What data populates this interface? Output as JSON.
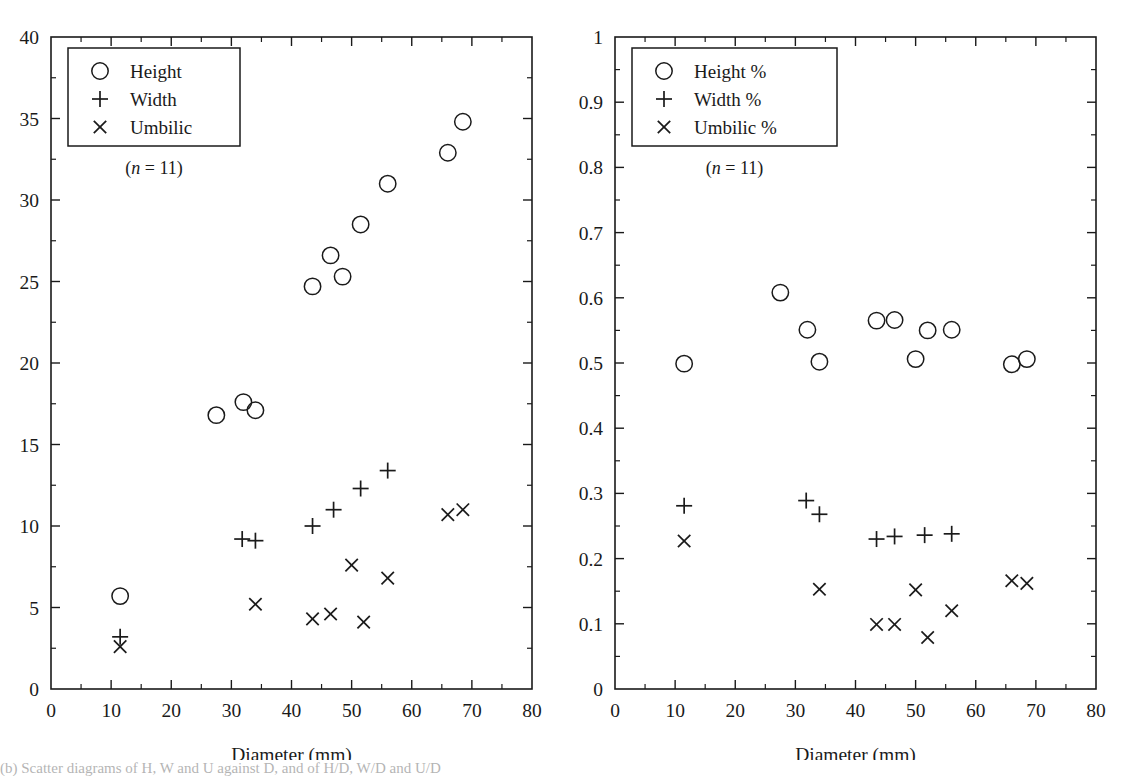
{
  "figure": {
    "panels": [
      "left",
      "right"
    ],
    "caption_partial": "(b) Scatter diagrams of H, W and U against D, and of H/D, W/D and U/D"
  },
  "chart_data": [
    {
      "type": "scatter",
      "panel": "left",
      "title": "",
      "xlabel": "Diameter (mm)",
      "ylabel": "",
      "xlim": [
        0,
        80
      ],
      "ylim": [
        0,
        40
      ],
      "xticks": [
        0,
        10,
        20,
        30,
        40,
        50,
        60,
        70,
        80
      ],
      "yticks": [
        0,
        5,
        10,
        15,
        20,
        25,
        30,
        35,
        40
      ],
      "xtick_labels": [
        "0",
        "10",
        "20",
        "30",
        "40",
        "50",
        "60",
        "70",
        "80"
      ],
      "ytick_labels": [
        "0",
        "5",
        "10",
        "15",
        "20",
        "25",
        "30",
        "35",
        "40"
      ],
      "grid": false,
      "legend_position": "upper-left",
      "legend_entries": [
        {
          "marker": "circle",
          "label": "Height"
        },
        {
          "marker": "plus",
          "label": "Width"
        },
        {
          "marker": "cross",
          "label": "Umbilic"
        }
      ],
      "annotation": "(n = 11)",
      "annotation_italic_part": "n",
      "x": [
        11.5,
        27.5,
        32.0,
        34.0,
        43.5,
        46.5,
        50.0,
        52.0,
        56.0,
        66.0,
        68.5
      ],
      "series": [
        {
          "name": "Height",
          "marker": "circle",
          "values": [
            5.7,
            16.8,
            17.6,
            17.1,
            24.7,
            26.6,
            25.3,
            28.5,
            31.0,
            32.9,
            34.8
          ]
        },
        {
          "name": "Width",
          "marker": "plus",
          "values": [
            3.2,
            null,
            9.2,
            9.1,
            10.0,
            11.0,
            12.3,
            null,
            13.4,
            null,
            null
          ]
        },
        {
          "name": "Umbilic",
          "marker": "cross",
          "values": [
            2.6,
            null,
            null,
            5.2,
            4.3,
            4.6,
            7.6,
            4.1,
            6.8,
            10.7,
            11.0
          ]
        }
      ],
      "points": [
        {
          "series": "Height",
          "x": 11.5,
          "y": 5.7
        },
        {
          "series": "Height",
          "x": 27.5,
          "y": 16.8
        },
        {
          "series": "Height",
          "x": 32.0,
          "y": 17.6
        },
        {
          "series": "Height",
          "x": 34.0,
          "y": 17.1
        },
        {
          "series": "Height",
          "x": 43.5,
          "y": 24.7
        },
        {
          "series": "Height",
          "x": 46.5,
          "y": 26.6
        },
        {
          "series": "Height",
          "x": 48.5,
          "y": 25.3
        },
        {
          "series": "Height",
          "x": 51.5,
          "y": 28.5
        },
        {
          "series": "Height",
          "x": 56.0,
          "y": 31.0
        },
        {
          "series": "Height",
          "x": 66.0,
          "y": 32.9
        },
        {
          "series": "Height",
          "x": 68.5,
          "y": 34.8
        },
        {
          "series": "Width",
          "x": 11.5,
          "y": 3.2
        },
        {
          "series": "Width",
          "x": 31.8,
          "y": 9.2
        },
        {
          "series": "Width",
          "x": 34.0,
          "y": 9.1
        },
        {
          "series": "Width",
          "x": 43.5,
          "y": 10.0
        },
        {
          "series": "Width",
          "x": 47.0,
          "y": 11.0
        },
        {
          "series": "Width",
          "x": 51.5,
          "y": 12.3
        },
        {
          "series": "Width",
          "x": 56.0,
          "y": 13.4
        },
        {
          "series": "Umbilic",
          "x": 11.5,
          "y": 2.6
        },
        {
          "series": "Umbilic",
          "x": 34.0,
          "y": 5.2
        },
        {
          "series": "Umbilic",
          "x": 43.5,
          "y": 4.3
        },
        {
          "series": "Umbilic",
          "x": 46.5,
          "y": 4.6
        },
        {
          "series": "Umbilic",
          "x": 50.0,
          "y": 7.6
        },
        {
          "series": "Umbilic",
          "x": 52.0,
          "y": 4.1
        },
        {
          "series": "Umbilic",
          "x": 56.0,
          "y": 6.8
        },
        {
          "series": "Umbilic",
          "x": 66.0,
          "y": 10.7
        },
        {
          "series": "Umbilic",
          "x": 68.5,
          "y": 11.0
        }
      ]
    },
    {
      "type": "scatter",
      "panel": "right",
      "title": "",
      "xlabel": "Diameter (mm)",
      "ylabel": "",
      "xlim": [
        0,
        80
      ],
      "ylim": [
        0,
        1
      ],
      "xticks": [
        0,
        10,
        20,
        30,
        40,
        50,
        60,
        70,
        80
      ],
      "yticks": [
        0,
        0.1,
        0.2,
        0.3,
        0.4,
        0.5,
        0.6,
        0.7,
        0.8,
        0.9,
        1
      ],
      "xtick_labels": [
        "0",
        "10",
        "20",
        "30",
        "40",
        "50",
        "60",
        "70",
        "80"
      ],
      "ytick_labels": [
        "0",
        "0.1",
        "0.2",
        "0.3",
        "0.4",
        "0.5",
        "0.6",
        "0.7",
        "0.8",
        "0.9",
        "1"
      ],
      "grid": false,
      "legend_position": "upper-left",
      "legend_entries": [
        {
          "marker": "circle",
          "label": "Height %"
        },
        {
          "marker": "plus",
          "label": "Width %"
        },
        {
          "marker": "cross",
          "label": "Umbilic %"
        }
      ],
      "annotation": "(n = 11)",
      "annotation_italic_part": "n",
      "x": [
        11.5,
        27.5,
        32.0,
        34.0,
        43.5,
        46.5,
        50.0,
        52.0,
        56.0,
        66.0,
        68.5
      ],
      "series": [
        {
          "name": "Height %",
          "marker": "circle",
          "values": [
            0.499,
            0.608,
            0.551,
            0.502,
            0.565,
            0.566,
            0.506,
            0.55,
            0.551,
            0.498,
            0.506
          ]
        },
        {
          "name": "Width %",
          "marker": "plus",
          "values": [
            0.281,
            null,
            0.289,
            0.268,
            0.23,
            0.234,
            0.236,
            null,
            0.238,
            null,
            null
          ]
        },
        {
          "name": "Umbilic %",
          "marker": "cross",
          "values": [
            0.227,
            null,
            null,
            0.153,
            0.099,
            0.099,
            0.152,
            0.079,
            0.12,
            0.166,
            0.162
          ]
        }
      ],
      "points": [
        {
          "series": "Height %",
          "x": 11.5,
          "y": 0.499
        },
        {
          "series": "Height %",
          "x": 27.5,
          "y": 0.608
        },
        {
          "series": "Height %",
          "x": 32.0,
          "y": 0.551
        },
        {
          "series": "Height %",
          "x": 34.0,
          "y": 0.502
        },
        {
          "series": "Height %",
          "x": 43.5,
          "y": 0.565
        },
        {
          "series": "Height %",
          "x": 46.5,
          "y": 0.566
        },
        {
          "series": "Height %",
          "x": 50.0,
          "y": 0.506
        },
        {
          "series": "Height %",
          "x": 52.0,
          "y": 0.55
        },
        {
          "series": "Height %",
          "x": 56.0,
          "y": 0.551
        },
        {
          "series": "Height %",
          "x": 66.0,
          "y": 0.498
        },
        {
          "series": "Height %",
          "x": 68.5,
          "y": 0.506
        },
        {
          "series": "Width %",
          "x": 11.5,
          "y": 0.281
        },
        {
          "series": "Width %",
          "x": 31.8,
          "y": 0.289
        },
        {
          "series": "Width %",
          "x": 34.0,
          "y": 0.268
        },
        {
          "series": "Width %",
          "x": 43.5,
          "y": 0.23
        },
        {
          "series": "Width %",
          "x": 46.5,
          "y": 0.234
        },
        {
          "series": "Width %",
          "x": 51.5,
          "y": 0.236
        },
        {
          "series": "Width %",
          "x": 56.0,
          "y": 0.238
        },
        {
          "series": "Umbilic %",
          "x": 11.5,
          "y": 0.227
        },
        {
          "series": "Umbilic %",
          "x": 34.0,
          "y": 0.153
        },
        {
          "series": "Umbilic %",
          "x": 43.5,
          "y": 0.099
        },
        {
          "series": "Umbilic %",
          "x": 46.5,
          "y": 0.099
        },
        {
          "series": "Umbilic %",
          "x": 50.0,
          "y": 0.152
        },
        {
          "series": "Umbilic %",
          "x": 52.0,
          "y": 0.079
        },
        {
          "series": "Umbilic %",
          "x": 56.0,
          "y": 0.12
        },
        {
          "series": "Umbilic %",
          "x": 66.0,
          "y": 0.166
        },
        {
          "series": "Umbilic %",
          "x": 68.5,
          "y": 0.162
        }
      ]
    }
  ],
  "style": {
    "axis_color": "#1a1a1a",
    "marker_color": "#1a1a1a",
    "background": "#ffffff"
  }
}
